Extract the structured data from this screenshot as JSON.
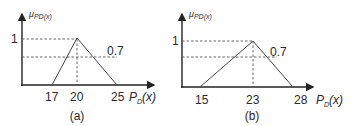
{
  "figures": [
    {
      "id": "a",
      "caption": "(a)",
      "y_axis_label": {
        "main": "μ",
        "sub": "PD(x)"
      },
      "x_axis_label": {
        "main": "P",
        "sub": "D",
        "suffix": "(x)"
      },
      "y_tick_label": "1",
      "alpha_label": "0.7",
      "triangle": {
        "left": 17,
        "peak": 20,
        "right": 25
      },
      "x_tick_labels": [
        "17",
        "20",
        "25"
      ],
      "alpha": 0.7
    },
    {
      "id": "b",
      "caption": "(b)",
      "y_axis_label": {
        "main": "μ",
        "sub": "PD(x)"
      },
      "x_axis_label": {
        "main": "P",
        "sub": "D",
        "suffix": "(x)"
      },
      "y_tick_label": "1",
      "alpha_label": "0.7",
      "triangle": {
        "left": 15,
        "peak": 23,
        "right": 28
      },
      "x_tick_labels": [
        "15",
        "23",
        "28"
      ],
      "alpha": 0.7
    }
  ]
}
